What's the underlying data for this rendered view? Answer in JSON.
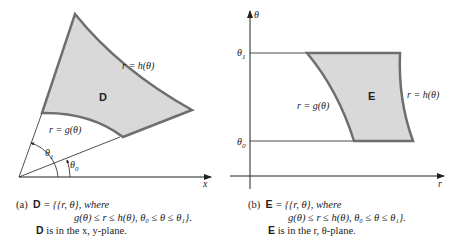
{
  "figure_a": {
    "region_label": "D",
    "outer_curve_label": "r = h(θ)",
    "inner_curve_label": "r = g(θ)",
    "angle_upper_label": "θ",
    "angle_upper_sub": "1",
    "angle_lower_label": "θ",
    "angle_lower_sub": "0",
    "axis_label": "x",
    "caption": {
      "tag": "(a)",
      "set_name": "D",
      "set_def": " = {{r, θ},  where",
      "condition": "g(θ) ≤ r ≤ h(θ),  θ₀ ≤ θ ≤ θ₁}.",
      "plane_name": "D",
      "plane_text": " is in the x, y-plane."
    }
  },
  "figure_b": {
    "region_label": "E",
    "right_curve_label": "r = h(θ)",
    "left_curve_label": "r = g(θ)",
    "y_axis_label": "θ",
    "x_axis_label": "r",
    "tick_upper_label": "θ",
    "tick_upper_sub": "1",
    "tick_lower_label": "θ",
    "tick_lower_sub": "0",
    "caption": {
      "tag": "(b)",
      "set_name": "E",
      "set_def": " = {{r, θ},  where",
      "condition": "g(θ) ≤ r ≤ h(θ),  θ₀ ≤ θ ≤ θ₁}.",
      "plane_name": "E",
      "plane_text": " is in the r, θ-plane."
    }
  },
  "colors": {
    "region_fill": "#d9d9d9",
    "region_stroke": "#6e6e6e",
    "line": "#222222"
  }
}
